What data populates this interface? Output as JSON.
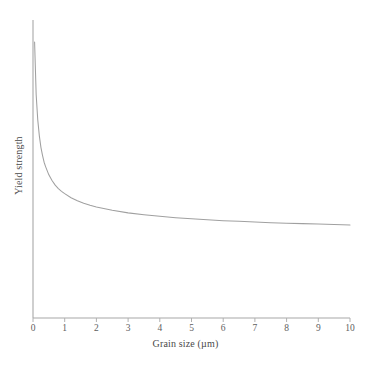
{
  "chart_data": {
    "type": "line",
    "title": "",
    "subtitle": "",
    "xlabel": "Grain size (µm)",
    "ylabel": "Yield strength",
    "xlim": [
      0,
      10
    ],
    "ylim": [
      0,
      1
    ],
    "grid": false,
    "legend": null,
    "xticks": [
      "0",
      "1",
      "2",
      "3",
      "4",
      "5",
      "6",
      "7",
      "8",
      "9",
      "10"
    ],
    "xtick_values": [
      0,
      1,
      2,
      3,
      4,
      5,
      6,
      7,
      8,
      9,
      10
    ],
    "yticks": [],
    "annotations": [],
    "series": [
      {
        "name": "Hall-Petch yield strength",
        "relationship": "inverse-square-root",
        "x": [
          0.05,
          0.1,
          0.15,
          0.2,
          0.25,
          0.3,
          0.35,
          0.4,
          0.5,
          0.6,
          0.7,
          0.8,
          0.9,
          1.0,
          1.2,
          1.4,
          1.6,
          1.8,
          2.0,
          2.5,
          3.0,
          3.5,
          4.0,
          4.5,
          5.0,
          5.5,
          6.0,
          6.5,
          7.0,
          7.5,
          8.0,
          8.5,
          9.0,
          9.5,
          10.0
        ],
        "y": [
          0.93,
          0.7,
          0.59,
          0.52,
          0.47,
          0.435,
          0.405,
          0.385,
          0.35,
          0.325,
          0.305,
          0.29,
          0.278,
          0.268,
          0.25,
          0.237,
          0.226,
          0.217,
          0.21,
          0.195,
          0.184,
          0.176,
          0.169,
          0.163,
          0.158,
          0.154,
          0.15,
          0.147,
          0.144,
          0.141,
          0.139,
          0.137,
          0.135,
          0.133,
          0.131
        ]
      }
    ]
  },
  "axes": {
    "line_color": "#a8a8a8",
    "curve_color": "#a0a0a0",
    "tick_color": "#b0b0b0",
    "x_axis_label": "Grain size (µm)",
    "y_axis_label": "Yield strength"
  },
  "colors": {
    "background": "#ffffff",
    "axis": "#a8a8a8",
    "curve": "#a0a0a0",
    "text": "#4a4a4a",
    "tick_text": "#5e5e5e"
  }
}
